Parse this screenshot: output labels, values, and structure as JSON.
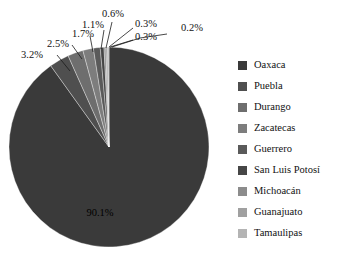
{
  "chart_data": {
    "type": "pie",
    "title": "",
    "categories": [
      "Oaxaca",
      "Puebla",
      "Durango",
      "Zacatecas",
      "Guerrero",
      "San Luis Potosí",
      "Michoacán",
      "Guanajuato",
      "Tamaulipas"
    ],
    "values": [
      90.1,
      3.2,
      2.5,
      1.7,
      1.1,
      0.6,
      0.3,
      0.3,
      0.2
    ],
    "value_labels": [
      "90.1%",
      "3.2%",
      "2.5%",
      "1.7%",
      "1.1%",
      "0.6%",
      "0.3%",
      "0.3%",
      "0.2%"
    ],
    "unit": "%",
    "total": 100.0,
    "legend_position": "right",
    "grid": false,
    "colors": [
      "#3a3a3a",
      "#4f4f4f",
      "#6e6e6e",
      "#7d7d7d",
      "#5a5a5a",
      "#464646",
      "#8c8c8c",
      "#a0a0a0",
      "#b4b4b4"
    ]
  },
  "legend": {
    "items": [
      {
        "label": "Oaxaca",
        "color": "#3a3a3a",
        "value_label": "90.1%"
      },
      {
        "label": "Puebla",
        "color": "#4f4f4f",
        "value_label": "3.2%"
      },
      {
        "label": "Durango",
        "color": "#6e6e6e",
        "value_label": "2.5%"
      },
      {
        "label": "Zacatecas",
        "color": "#7d7d7d",
        "value_label": "1.7%"
      },
      {
        "label": "Guerrero",
        "color": "#5a5a5a",
        "value_label": "1.1%"
      },
      {
        "label": "San Luis Potosí",
        "color": "#464646",
        "value_label": "0.6%"
      },
      {
        "label": "Michoacán",
        "color": "#8c8c8c",
        "value_label": "0.3%"
      },
      {
        "label": "Guanajuato",
        "color": "#a0a0a0",
        "value_label": "0.3%"
      },
      {
        "label": "Tamaulipas",
        "color": "#b4b4b4",
        "value_label": "0.2%"
      }
    ]
  },
  "pie_labels": {
    "oaxaca": "90.1%",
    "puebla": "3.2%",
    "durango": "2.5%",
    "zacatecas": "1.7%",
    "guerrero": "1.1%",
    "san_luis_potosi": "0.6%",
    "michoacan": "0.3%",
    "guanajuato": "0.3%",
    "tamaulipas": "0.2%"
  }
}
